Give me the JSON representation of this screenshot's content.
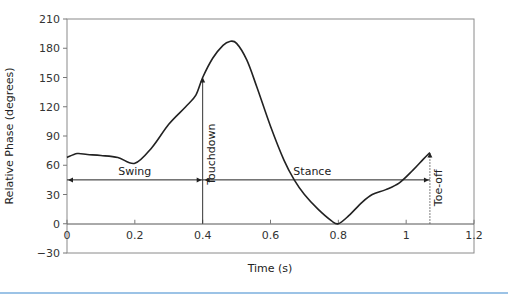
{
  "chart_data": {
    "type": "line",
    "title": "",
    "xlabel": "Time (s)",
    "ylabel": "Relative Phase (degrees)",
    "xlim": [
      0,
      1.2
    ],
    "ylim": [
      -30,
      210
    ],
    "x_ticks": [
      0,
      0.2,
      0.4,
      0.6,
      0.8,
      1,
      1.2
    ],
    "x_tick_labels": [
      "0",
      "0.2",
      "0.4",
      "0.6",
      "0.8",
      "1",
      "1.2"
    ],
    "y_ticks": [
      -30,
      0,
      30,
      60,
      90,
      120,
      150,
      180,
      210
    ],
    "y_tick_labels": [
      "-30",
      "0",
      "30",
      "60",
      "90",
      "120",
      "150",
      "180",
      "210"
    ],
    "grid": false,
    "legend": null,
    "series": [
      {
        "name": "Relative Phase",
        "x": [
          0,
          0.03,
          0.06,
          0.1,
          0.15,
          0.2,
          0.25,
          0.3,
          0.35,
          0.38,
          0.4,
          0.43,
          0.46,
          0.48,
          0.5,
          0.53,
          0.56,
          0.6,
          0.64,
          0.67,
          0.7,
          0.74,
          0.78,
          0.8,
          0.83,
          0.87,
          0.9,
          0.94,
          0.98,
          1.02,
          1.05,
          1.07
        ],
        "values": [
          68,
          72,
          71,
          70,
          68,
          62,
          78,
          102,
          120,
          132,
          150,
          170,
          183,
          187,
          185,
          168,
          140,
          100,
          65,
          45,
          30,
          15,
          3,
          0,
          8,
          22,
          30,
          35,
          42,
          55,
          66,
          73
        ]
      }
    ],
    "annotations": [
      {
        "text": "Swing",
        "type": "double-arrow",
        "x_start": 0,
        "x_end": 0.4,
        "y": 45
      },
      {
        "text": "Touchdown",
        "type": "vertical-arrow",
        "x": 0.4,
        "y_start": 0,
        "y_end": 150,
        "rotated": true
      },
      {
        "text": "Stance",
        "type": "arrow",
        "x_start": 0.4,
        "x_end": 1.07,
        "y": 45
      },
      {
        "text": "Toe-off",
        "type": "dotted-vertical",
        "x": 1.07,
        "y_start": 0,
        "y_end": 73,
        "rotated": true
      }
    ]
  },
  "labels": {
    "xlabel": "Time (s)",
    "ylabel": "Relative Phase (degrees)",
    "swing": "Swing",
    "stance": "Stance",
    "touchdown": "Touchdown",
    "toeoff": "Toe-off"
  }
}
